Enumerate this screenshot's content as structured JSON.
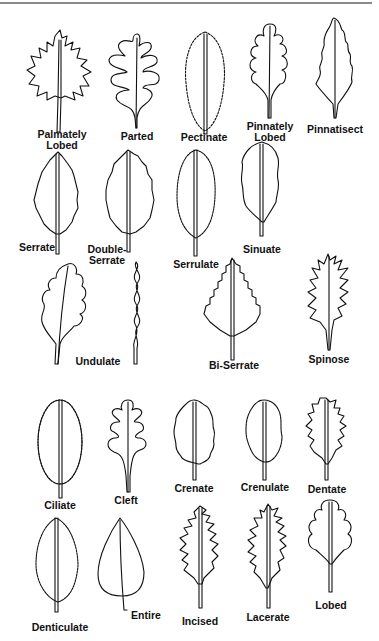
{
  "diagram": {
    "title": "",
    "type": "leaf margin types",
    "leaves": [
      {
        "id": "palmately-lobed",
        "label_lines": [
          "Palmately",
          "Lobed"
        ]
      },
      {
        "id": "parted",
        "label_lines": [
          "Parted"
        ]
      },
      {
        "id": "pectinate",
        "label_lines": [
          "Pectinate"
        ]
      },
      {
        "id": "pinnately-lobed",
        "label_lines": [
          "Pinnately",
          "Lobed"
        ]
      },
      {
        "id": "pinnatisect",
        "label_lines": [
          "Pinnatisect"
        ]
      },
      {
        "id": "serrate",
        "label_lines": [
          "Serrate"
        ]
      },
      {
        "id": "double-serrate",
        "label_lines": [
          "Double-",
          "Serrate"
        ]
      },
      {
        "id": "serrulate",
        "label_lines": [
          "Serrulate"
        ]
      },
      {
        "id": "sinuate",
        "label_lines": [
          "Sinuate"
        ]
      },
      {
        "id": "undulate",
        "label_lines": [
          "Undulate"
        ]
      },
      {
        "id": "bi-serrate",
        "label_lines": [
          "Bi-Serrate"
        ]
      },
      {
        "id": "spinose",
        "label_lines": [
          "Spinose"
        ]
      },
      {
        "id": "ciliate",
        "label_lines": [
          "Ciliate"
        ]
      },
      {
        "id": "cleft",
        "label_lines": [
          "Cleft"
        ]
      },
      {
        "id": "crenate",
        "label_lines": [
          "Crenate"
        ]
      },
      {
        "id": "crenulate",
        "label_lines": [
          "Crenulate"
        ]
      },
      {
        "id": "dentate",
        "label_lines": [
          "Dentate"
        ]
      },
      {
        "id": "denticulate",
        "label_lines": [
          "Denticulate"
        ]
      },
      {
        "id": "entire",
        "label_lines": [
          "Entire"
        ]
      },
      {
        "id": "incised",
        "label_lines": [
          "Incised"
        ]
      },
      {
        "id": "lacerate",
        "label_lines": [
          "Lacerate"
        ]
      },
      {
        "id": "lobed",
        "label_lines": [
          "Lobed"
        ]
      }
    ]
  }
}
